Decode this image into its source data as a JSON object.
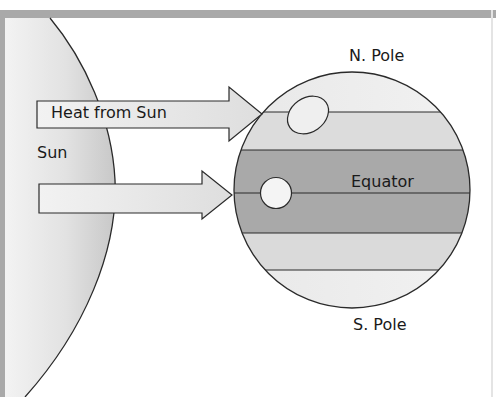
{
  "diagram": {
    "labels": {
      "heat_from_sun": "Heat from Sun",
      "sun": "Sun",
      "north_pole": "N. Pole",
      "equator": "Equator",
      "south_pole": "S. Pole"
    },
    "colors": {
      "frame": "#a9a9a9",
      "sun_fill_dark": "#bdbdbd",
      "sun_fill_light": "#ececec",
      "arrow_fill": "#eeeeee",
      "polar_band": "#ececec",
      "temperate_band": "#d9d9d9",
      "equatorial_band": "#a8a8a8",
      "outline": "#2a2a2a"
    }
  }
}
